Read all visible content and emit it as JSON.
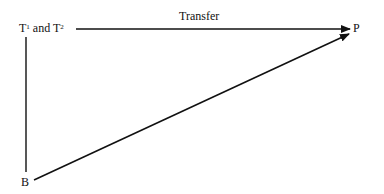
{
  "diagram": {
    "nodes": {
      "t": {
        "base1": "T",
        "sup1": "1",
        "mid": " and ",
        "base2": "T",
        "sup2": "2"
      },
      "p": "P",
      "b": "B"
    },
    "edges": [
      {
        "from": "T1 and T2",
        "to": "P",
        "label": "Transfer",
        "arrow": true
      },
      {
        "from": "T1 and T2",
        "to": "B",
        "label": "",
        "arrow": false
      },
      {
        "from": "B",
        "to": "P",
        "label": "",
        "arrow": true
      }
    ],
    "edge_label_transfer": "Transfer"
  }
}
